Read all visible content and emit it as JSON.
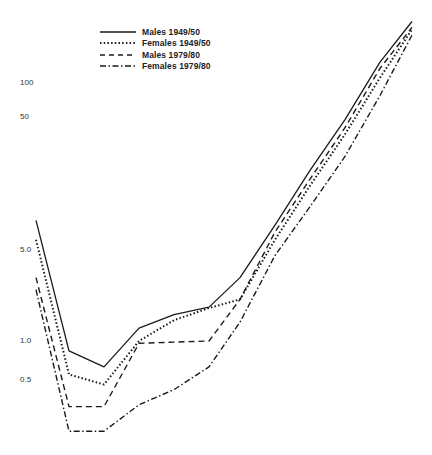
{
  "chart_data": {
    "type": "line",
    "title": "",
    "xlabel": "",
    "ylabel": "",
    "yscale": "log",
    "grid": false,
    "legend_position": "top-left",
    "yticks": [
      100,
      50,
      5.0,
      1.0,
      0.5
    ],
    "ytick_labels": [
      "100",
      "50",
      "5.0",
      "1.0",
      "0.5"
    ],
    "x": [
      1,
      2,
      3,
      4,
      5,
      6,
      7,
      8,
      9,
      10,
      11,
      12
    ],
    "series": [
      {
        "name": "Males 1949/50",
        "style": "solid",
        "values": [
          8.6,
          0.84,
          0.63,
          1.26,
          1.6,
          1.83,
          3.1,
          7.9,
          21,
          52,
          145,
          300
        ]
      },
      {
        "name": "Females 1949/50",
        "style": "dotted",
        "values": [
          6.1,
          0.55,
          0.46,
          1.0,
          1.45,
          1.8,
          2.1,
          6.1,
          16,
          40,
          110,
          260
        ]
      },
      {
        "name": "Males 1979/80",
        "style": "dashed",
        "values": [
          3.1,
          0.31,
          0.31,
          0.96,
          0.98,
          1.0,
          2.1,
          7.0,
          18,
          45,
          130,
          270
        ]
      },
      {
        "name": "Females 1979/80",
        "style": "dash-dot",
        "values": [
          2.5,
          0.2,
          0.2,
          0.32,
          0.42,
          0.63,
          1.4,
          4.6,
          11,
          27,
          80,
          235
        ]
      }
    ]
  },
  "legend": {
    "items": [
      {
        "label": "Males 1949/50"
      },
      {
        "label": "Females 1949/50"
      },
      {
        "label": "Males 1979/80"
      },
      {
        "label": "Females 1979/80"
      }
    ]
  },
  "axis": {
    "y_labels": [
      {
        "text": "100",
        "y": 83
      },
      {
        "text": "50",
        "y": 117
      },
      {
        "text": "5.0",
        "y": 250
      },
      {
        "text": "1.0",
        "y": 341
      },
      {
        "text": "0.5",
        "y": 380
      }
    ]
  },
  "colors": {
    "line": "#1a1a1a",
    "text": "#333333"
  }
}
